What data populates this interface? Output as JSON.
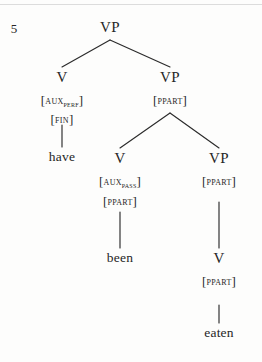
{
  "figure": {
    "example_number": "5",
    "ink_color": "#262626",
    "page_color": "#fdfdfc",
    "rule_color": "#dcdcdc"
  },
  "nodes": {
    "root_vp": "VP",
    "left_v": "V",
    "left_feat_aux": "AUX",
    "left_feat_aux_sub": "PERF",
    "left_feat_fin": "FIN",
    "left_word": "have",
    "mid_vp": "VP",
    "mid_vp_feat": "PPART",
    "mid_v": "V",
    "mid_feat_aux": "AUX",
    "mid_feat_aux_sub": "PASS",
    "mid_feat_ppart": "PPART",
    "mid_word": "been",
    "right_vp": "VP",
    "right_vp_feat": "PPART",
    "right_v": "V",
    "right_v_feat": "PPART",
    "right_word": "eaten"
  },
  "brackets": {
    "open": "[",
    "close": "]"
  }
}
